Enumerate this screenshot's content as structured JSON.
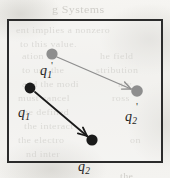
{
  "figure": {
    "caption_visible": false,
    "media": "scanned-book-page",
    "frame": {
      "x": 7,
      "y": 19,
      "width": 156,
      "height": 144,
      "border_color": "#2b2b2b",
      "border_width_px": 2
    },
    "background_color": "#f3f2ef",
    "paper_tint": "#efeeea"
  },
  "colors": {
    "initial_charge": "#8e8e8e",
    "final_charge": "#1a1a1a",
    "initial_arrow": "#8e8e8e",
    "final_arrow": "#1a1a1a",
    "frame": "#2b2b2b",
    "label": "#1d1d1d",
    "ghost_text": "#b9b7b1"
  },
  "charges": [
    {
      "id": "q1-prime",
      "label_base": "q",
      "label_sub": "1",
      "prime": "'",
      "state": "initial",
      "color": "#8e8e8e",
      "cx": 52,
      "cy": 54,
      "r": 5.6,
      "label_x": 40,
      "label_y": 64,
      "prime_x": 51,
      "prime_y": 60
    },
    {
      "id": "q2-prime",
      "label_base": "q",
      "label_sub": "2",
      "prime": "'",
      "state": "initial",
      "color": "#8e8e8e",
      "cx": 137,
      "cy": 91,
      "r": 5.8,
      "label_x": 125,
      "label_y": 110,
      "prime_x": 136,
      "prime_y": 101
    },
    {
      "id": "q1",
      "label_base": "q",
      "label_sub": "1",
      "prime": "",
      "state": "final",
      "color": "#1a1a1a",
      "cx": 30,
      "cy": 88,
      "r": 5.4,
      "label_x": 18,
      "label_y": 106,
      "prime_x": 0,
      "prime_y": 0
    },
    {
      "id": "q2",
      "label_base": "q",
      "label_sub": "2",
      "prime": "",
      "state": "final",
      "color": "#1a1a1a",
      "cx": 92,
      "cy": 140,
      "r": 5.6,
      "label_x": 78,
      "label_y": 160,
      "prime_x": 0,
      "prime_y": 0
    }
  ],
  "vectors": [
    {
      "id": "displacement-q1-prime-to-q2-prime",
      "from": "q1-prime",
      "to": "q2-prime",
      "x1": 57,
      "y1": 57,
      "x2": 131,
      "y2": 89,
      "color": "#8e8e8e",
      "width": 1.3,
      "arrowhead": "open-v"
    },
    {
      "id": "displacement-q1-to-q2",
      "from": "q1",
      "to": "q2",
      "x1": 35,
      "y1": 92,
      "x2": 87,
      "y2": 136,
      "color": "#1a1a1a",
      "width": 1.8,
      "arrowhead": "open-v"
    }
  ],
  "ghost_text": [
    {
      "text": "g Systems",
      "x": 52,
      "y": 2,
      "size": 12
    },
    {
      "text": "ent implies a nonzero",
      "x": 16,
      "y": 24,
      "size": 10
    },
    {
      "text": "to this value.",
      "x": 20,
      "y": 38,
      "size": 10
    },
    {
      "text": "ation in",
      "x": 22,
      "y": 50,
      "size": 10
    },
    {
      "text": "he field",
      "x": 100,
      "y": 50,
      "size": 10
    },
    {
      "text": "to use the",
      "x": 22,
      "y": 64,
      "size": 10
    },
    {
      "text": "stribution",
      "x": 96,
      "y": 64,
      "size": 10
    },
    {
      "text": "and the modi",
      "x": 22,
      "y": 78,
      "size": 10
    },
    {
      "text": "nly",
      "x": 118,
      "y": 78,
      "size": 10
    },
    {
      "text": "must cancel",
      "x": 18,
      "y": 92,
      "size": 10
    },
    {
      "text": "ross",
      "x": 112,
      "y": 92,
      "size": 10
    },
    {
      "text": "the defined",
      "x": 20,
      "y": 106,
      "size": 10
    },
    {
      "text": "the interact",
      "x": 24,
      "y": 120,
      "size": 10
    },
    {
      "text": "the electro",
      "x": 18,
      "y": 134,
      "size": 10
    },
    {
      "text": "on",
      "x": 130,
      "y": 134,
      "size": 10
    },
    {
      "text": "nd inter",
      "x": 26,
      "y": 148,
      "size": 10
    },
    {
      "text": "the",
      "x": 120,
      "y": 170,
      "size": 10
    }
  ]
}
